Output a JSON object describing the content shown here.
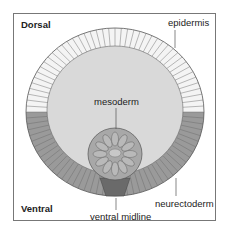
{
  "figure": {
    "orientation_labels": {
      "top": "Dorsal",
      "bottom": "Ventral"
    },
    "structures": [
      {
        "id": "epidermis",
        "label": "epidermis"
      },
      {
        "id": "mesoderm",
        "label": "mesoderm"
      },
      {
        "id": "neurectoderm",
        "label": "neurectoderm"
      },
      {
        "id": "ventral_midline",
        "label": "ventral midline"
      }
    ],
    "colors": {
      "frame": "#777777",
      "epidermis_cells": "#ffffff",
      "neurectoderm_cells": "#9a9a9a",
      "interior": "#d9d9d9",
      "mesoderm": "#a8a8a8",
      "midline": "#6a6a6a",
      "outline": "#555555"
    }
  }
}
